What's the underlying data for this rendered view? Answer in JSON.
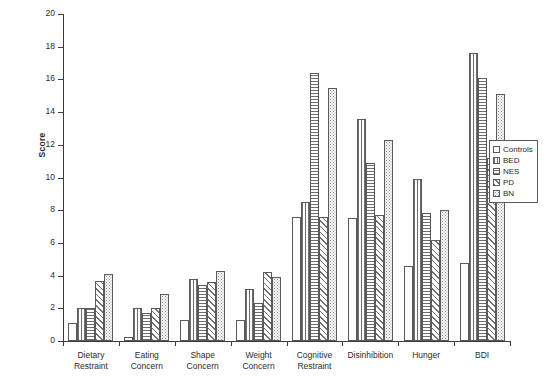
{
  "chart_data": {
    "type": "bar",
    "title": "",
    "subtitle": "",
    "xlabel": "",
    "ylabel": "Score",
    "ylim": [
      0,
      20
    ],
    "ytick_step": 2,
    "yticks": [
      0,
      2,
      4,
      6,
      8,
      10,
      12,
      14,
      16,
      18,
      20
    ],
    "ytick_labels": [
      "0",
      "2",
      "4",
      "6",
      "8",
      "10",
      "12",
      "14",
      "16",
      "18",
      "20"
    ],
    "grid": false,
    "legend_position": "right",
    "categories": [
      "Dietary\nRestraint",
      "Eating\nConcern",
      "Shape\nConcern",
      "Weight\nConcern",
      "Cognitive\nRestraint",
      "Disinhibition",
      "Hunger",
      "BDI"
    ],
    "series": [
      {
        "name": "Controls",
        "pattern": "blank",
        "values": [
          1.1,
          0.25,
          1.3,
          1.3,
          7.6,
          7.5,
          4.6,
          4.8
        ]
      },
      {
        "name": "BED",
        "pattern": "vertical-lines",
        "values": [
          2.0,
          2.0,
          3.8,
          3.2,
          8.5,
          13.6,
          9.9,
          17.6
        ]
      },
      {
        "name": "NES",
        "pattern": "horizontal-lines",
        "values": [
          2.0,
          1.7,
          3.4,
          2.3,
          16.4,
          10.9,
          7.8,
          16.1
        ]
      },
      {
        "name": "PD",
        "pattern": "diagonal-hatch",
        "values": [
          3.7,
          2.0,
          3.6,
          4.2,
          7.6,
          7.7,
          6.2,
          11.2
        ]
      },
      {
        "name": "BN",
        "pattern": "dots",
        "values": [
          4.1,
          2.9,
          4.3,
          3.9,
          15.5,
          12.3,
          8.0,
          15.1
        ]
      }
    ]
  },
  "legend": {
    "items": [
      {
        "label": "Controls",
        "pattern": "blank"
      },
      {
        "label": "BED",
        "pattern": "vertical-lines"
      },
      {
        "label": "NES",
        "pattern": "horizontal-lines"
      },
      {
        "label": "PD",
        "pattern": "diagonal-hatch"
      },
      {
        "label": "BN",
        "pattern": "dots"
      }
    ]
  },
  "axis": {
    "y_title": "Score"
  }
}
